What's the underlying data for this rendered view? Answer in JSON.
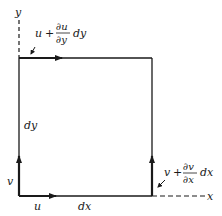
{
  "diagram": {
    "type": "fluid-element-velocity-diagram",
    "axes": {
      "x_label": "x",
      "y_label": "y"
    },
    "element": {
      "width_label": "dx",
      "height_label": "dy"
    },
    "velocities": {
      "bottom_left_horizontal": "u",
      "bottom_left_vertical": "v",
      "top_edge": {
        "base": "u",
        "plus": "+",
        "numerator": "∂u",
        "denominator": "∂y",
        "suffix": "dy"
      },
      "right_edge": {
        "base": "v",
        "plus": "+",
        "numerator": "∂v",
        "denominator": "∂x",
        "suffix": "dx"
      }
    },
    "colors": {
      "line": "#1a1a1a",
      "background": "#ffffff"
    }
  }
}
